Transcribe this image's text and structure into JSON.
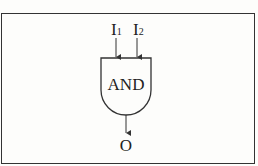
{
  "diagram": {
    "gate": {
      "label": "AND",
      "type": "AND gate"
    },
    "inputs": [
      {
        "label": "I",
        "subscript": "1"
      },
      {
        "label": "I",
        "subscript": "2"
      }
    ],
    "output": {
      "label": "O"
    },
    "colors": {
      "stroke": "#333333",
      "background": "#fdfdfb"
    }
  }
}
